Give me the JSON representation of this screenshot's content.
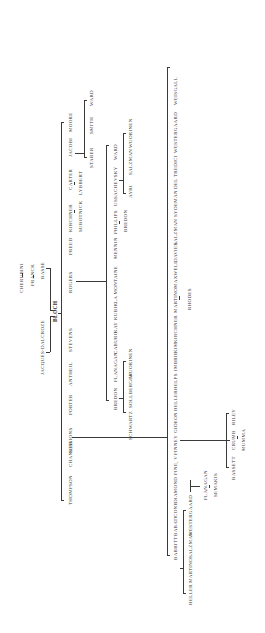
{
  "tree": {
    "group_a": {
      "trunk": "Sessions lineage",
      "names": [
        "THOMPSON",
        "CHANLER",
        "SESSIONS",
        "PORTER",
        "ANTHEIL",
        "STEVENS",
        "ROGERS",
        "FREED",
        "KIRCHNER",
        "CARTER",
        "JACOBI",
        "MOORE"
      ],
      "sub": {
        "kirchner": "SUBOTNICK",
        "carter": "LYBBERT",
        "jacobi_children": [
          "STARER",
          "SMITH",
          "WARD"
        ]
      }
    },
    "teachers": {
      "cherubini": "CHERUBINI",
      "franck": "FRANCK",
      "basse": "BASSE",
      "bloch": "BLOCH",
      "jacques_dalcroze": "JACQUES-DALCROZE"
    },
    "group_b": {
      "names": [
        "BREDON",
        "FLANAGAN",
        "CABURO",
        "KAY",
        "KUBIK",
        "LA MONTAINE",
        "MENNIN",
        "PHILLIPS",
        "USSACHEVSKY",
        "WARD"
      ],
      "bredon_children": [
        "SCHWARTZ",
        "SOLLBERGER",
        "WUORINEN"
      ],
      "phillips_child": "BREDON",
      "ussachevsky_children": [
        "AYRI",
        "SALZMAN",
        "WUORINEN"
      ]
    },
    "group_c": {
      "names": [
        "BABBITT",
        "BABATI",
        "CONE",
        "DIAMOND",
        "FINE, V",
        "FINNEY",
        "GIDEON",
        "HELLER",
        "HELPS",
        "IMBRIE",
        "KIM",
        "KIRCHNER",
        "MARTINO",
        "MAXWELL",
        "DAVIES",
        "SALZMAN",
        "SYDEMAN",
        "DEL TREDICI",
        "WESTERGAARD",
        "WEISGALL"
      ],
      "martino_child": "RHODES",
      "babbitt_children": [
        "HELLER",
        "MARTINO",
        "SALZMAN",
        "WESTERGAARD"
      ],
      "diamond_child": "FLANAGAN",
      "flanagan_child": "SEMAKIS",
      "finney_children": [
        "BASSETT",
        "CRUMB",
        "RILEY"
      ],
      "crumb_child": "MUMMA"
    }
  }
}
